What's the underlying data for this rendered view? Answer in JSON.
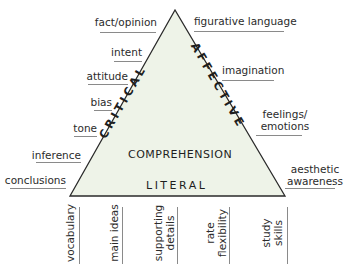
{
  "colors": {
    "triangle_fill": "#eef3e8",
    "triangle_stroke": "#2a2a2a",
    "rule": "#8a8a8a",
    "text": "#2b2b2b"
  },
  "triangle": {
    "center_label": "COMPREHENSION",
    "base_label": "LITERAL",
    "left_side_label": "CRITICAL",
    "right_side_label": "AFFECTIVE"
  },
  "left_labels": [
    "fact/opinion",
    "intent",
    "attitude",
    "bias",
    "tone",
    "inference",
    "conclusions"
  ],
  "right_labels": [
    {
      "line1": "figurative language",
      "line2": ""
    },
    {
      "line1": "imagination",
      "line2": ""
    },
    {
      "line1": "feelings/",
      "line2": "emotions"
    },
    {
      "line1": "aesthetic",
      "line2": "awareness"
    }
  ],
  "bottom_labels": [
    {
      "line1": "vocabulary",
      "line2": ""
    },
    {
      "line1": "main ideas",
      "line2": ""
    },
    {
      "line1": "supporting",
      "line2": "details"
    },
    {
      "line1": "rate",
      "line2": "flexibility"
    },
    {
      "line1": "study",
      "line2": "skills"
    }
  ]
}
